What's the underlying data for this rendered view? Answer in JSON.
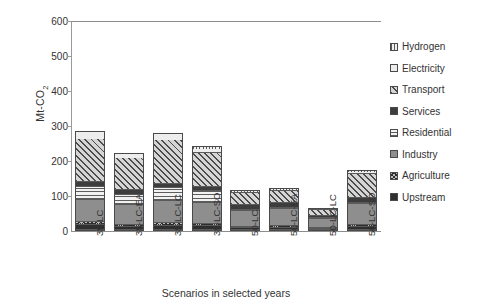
{
  "chart_data": {
    "type": "bar",
    "subtype": "stacked-bar",
    "title": "",
    "xlabel": "Scenarios in selected  years",
    "ylabel": "Mt-CO2",
    "ylabel_html": "Mt-CO<sub>2</sub>",
    "ylim": [
      0,
      600
    ],
    "yticks": [
      0,
      100,
      200,
      300,
      400,
      500,
      600
    ],
    "ytick_labels": [
      "0",
      "100",
      "200",
      "300",
      "400",
      "500",
      "600"
    ],
    "grid": false,
    "legend_position": "right",
    "categories": [
      "35-LC",
      "35-LC-EA",
      "35-LC-LC",
      "35-LC-SO",
      "50-LC",
      "50-LC-EA",
      "50-LC-LC",
      "50-LC-SO"
    ],
    "series": [
      {
        "name": "Upstream",
        "pattern": "solid-dark",
        "color": "#2f2f2f",
        "values": [
          14,
          10,
          13,
          11,
          6,
          7,
          4,
          9
        ]
      },
      {
        "name": "Agriculture",
        "pattern": "cross-hatch",
        "color": "#b9b9b9",
        "values": [
          8,
          6,
          8,
          7,
          4,
          4,
          3,
          5
        ]
      },
      {
        "name": "Industry",
        "pattern": "solid-gray",
        "color": "#8e8e8e",
        "values": [
          66,
          58,
          64,
          62,
          48,
          52,
          30,
          62
        ]
      },
      {
        "name": "Residential",
        "pattern": "horizontal-lines",
        "color": "#f2f2f2",
        "values": [
          38,
          30,
          36,
          34,
          2,
          2,
          1,
          3
        ]
      },
      {
        "name": "Services",
        "pattern": "solid-darkgray",
        "color": "#3d3d3d",
        "values": [
          14,
          12,
          14,
          12,
          16,
          17,
          5,
          16
        ]
      },
      {
        "name": "Transport",
        "pattern": "diagonal-hatch",
        "color": "#d5d5d5",
        "values": [
          126,
          96,
          128,
          98,
          36,
          36,
          20,
          72
        ]
      },
      {
        "name": "Electricity",
        "pattern": "plain-light",
        "color": "#ededed",
        "values": [
          19,
          10,
          17,
          12,
          3,
          3,
          2,
          3
        ]
      },
      {
        "name": "Hydrogen",
        "pattern": "vertical-lines",
        "color": "#f0f0f0",
        "values": [
          0,
          0,
          0,
          6,
          2,
          2,
          1,
          3
        ]
      }
    ],
    "totals": [
      285,
      222,
      280,
      242,
      117,
      123,
      66,
      173
    ]
  },
  "legend": {
    "entries": [
      {
        "label": "Hydrogen",
        "icon": "swatch-vertical-lines-icon"
      },
      {
        "label": "Electricity",
        "icon": "swatch-plain-light-icon"
      },
      {
        "label": "Transport",
        "icon": "swatch-diagonal-hatch-icon"
      },
      {
        "label": "Services",
        "icon": "swatch-solid-darkgray-icon"
      },
      {
        "label": "Residential",
        "icon": "swatch-horizontal-lines-icon"
      },
      {
        "label": "Industry",
        "icon": "swatch-solid-gray-icon"
      },
      {
        "label": "Agriculture",
        "icon": "swatch-cross-hatch-icon"
      },
      {
        "label": "Upstream",
        "icon": "swatch-solid-dark-icon"
      }
    ]
  }
}
